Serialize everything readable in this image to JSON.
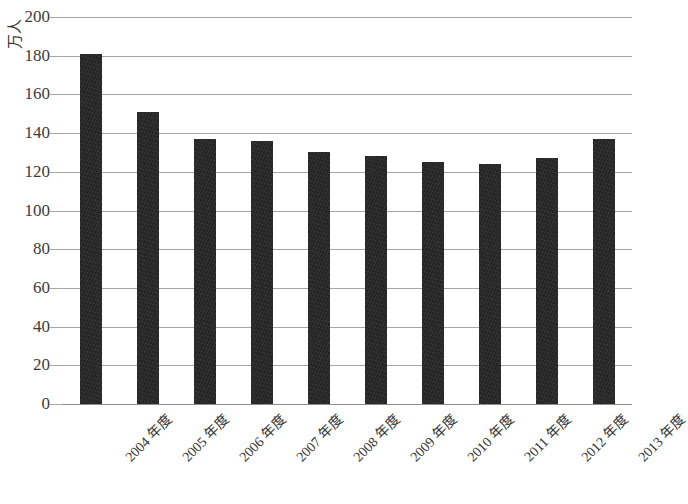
{
  "chart_data": {
    "type": "bar",
    "title": "",
    "xlabel": "",
    "ylabel": "万人",
    "categories": [
      "2004 年度",
      "2005 年度",
      "2006 年度",
      "2007 年度",
      "2008 年度",
      "2009 年度",
      "2010 年度",
      "2011 年度",
      "2012 年度",
      "2013 年度"
    ],
    "values": [
      181,
      151,
      137,
      136,
      130,
      128,
      125,
      124,
      127,
      137
    ],
    "ylim": [
      0,
      200
    ],
    "ytick_labels": [
      "200",
      "180",
      "160",
      "140",
      "120",
      "100",
      "80",
      "60",
      "40",
      "20",
      "0"
    ],
    "ytick_values": [
      200,
      180,
      160,
      140,
      120,
      100,
      80,
      60,
      40,
      20,
      0
    ],
    "grid": true,
    "legend": "none",
    "series_color": "#252525",
    "gridline_color": "#a6a6a6"
  },
  "footer": {
    "note": ""
  }
}
